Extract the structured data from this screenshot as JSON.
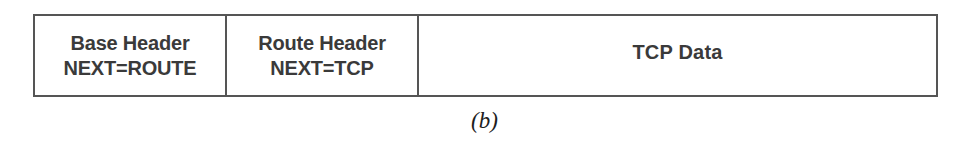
{
  "figure": {
    "caption": "(b)",
    "colors": {
      "border": "#555555",
      "text": "#3a3a3a",
      "caption_text": "#1d1d1d",
      "background": "#ffffff"
    },
    "packet": {
      "name": "IPv6 datagram with route extension header",
      "fields": [
        {
          "id": "base-header",
          "line1": "Base Header",
          "line2": "NEXT=ROUTE"
        },
        {
          "id": "route-header",
          "line1": "Route Header",
          "line2": "NEXT=TCP"
        },
        {
          "id": "tcp-data",
          "line1": "TCP Data",
          "line2": ""
        }
      ]
    }
  }
}
